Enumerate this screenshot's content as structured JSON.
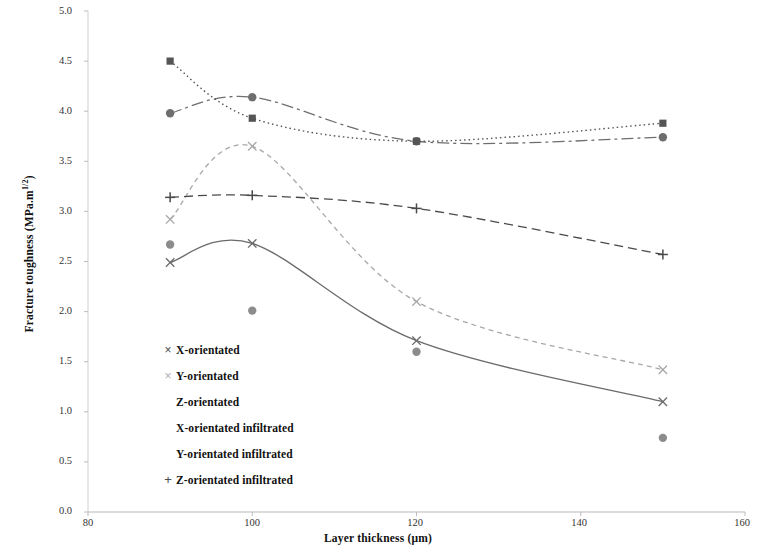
{
  "chart_data": {
    "type": "line",
    "title": "",
    "xlabel": "Layer thickness (μm)",
    "ylabel": "Fracture toughness (MPa.m1/2)",
    "ylabel_base": "Fracture toughness (MPa.m",
    "ylabel_sup": "1/2",
    "ylabel_tail": ")",
    "xlim": [
      80,
      160
    ],
    "ylim": [
      0.0,
      5.0
    ],
    "xticks": [
      80,
      100,
      120,
      140,
      160
    ],
    "yticks": [
      "0.0",
      "0.5",
      "1.0",
      "1.5",
      "2.0",
      "2.5",
      "3.0",
      "3.5",
      "4.0",
      "4.5",
      "5.0"
    ],
    "grid": false,
    "legend_position": "inside-lower-left",
    "x": [
      90,
      100,
      120,
      150
    ],
    "series": [
      {
        "name": "X-orientated",
        "marker": "x",
        "color": "#6b6b6b",
        "line_style": "solid",
        "values": [
          2.49,
          2.68,
          1.71,
          1.1
        ]
      },
      {
        "name": "Y-orientated",
        "marker": "x",
        "color": "#a8a8a8",
        "line_style": "dashed",
        "values": [
          2.92,
          3.65,
          2.1,
          1.42
        ]
      },
      {
        "name": "Z-orientated",
        "marker": "circle",
        "color": "#8c8c8c",
        "line_style": "none",
        "values": [
          2.67,
          2.01,
          1.6,
          0.74
        ]
      },
      {
        "name": "X-orientated infiltrated",
        "marker": "circle",
        "color": "#6e6e6e",
        "line_style": "dash-dot",
        "values": [
          3.98,
          4.14,
          3.7,
          3.74
        ]
      },
      {
        "name": "Y-orientated infiltrated",
        "marker": "square",
        "color": "#555555",
        "line_style": "dotted",
        "values": [
          4.5,
          3.93,
          3.7,
          3.88
        ]
      },
      {
        "name": "Z-orientated infiltrated",
        "marker": "plus",
        "color": "#4a4a4a",
        "line_style": "dashed-long",
        "values": [
          3.14,
          3.16,
          3.03,
          2.57
        ]
      }
    ]
  },
  "legend": {
    "items": [
      {
        "label": "X-orientated",
        "marker": "x-marker-icon"
      },
      {
        "label": "Y-orientated",
        "marker": "x-light-marker-icon"
      },
      {
        "label": "Z-orientated",
        "marker": "circle-marker-icon"
      },
      {
        "label": "X-orientated infiltrated",
        "marker": "circle-dark-marker-icon"
      },
      {
        "label": "Y-orientated infiltrated",
        "marker": "square-marker-icon"
      },
      {
        "label": "Z-orientated infiltrated",
        "marker": "plus-marker-icon"
      }
    ]
  },
  "axes": {
    "y_tick_labels": [
      "5.0",
      "4.5",
      "4.0",
      "3.5",
      "3.0",
      "2.5",
      "2.0",
      "1.5",
      "1.0",
      "0.5",
      "0.0"
    ],
    "x_tick_labels": [
      "80",
      "100",
      "120",
      "140",
      "160"
    ]
  }
}
